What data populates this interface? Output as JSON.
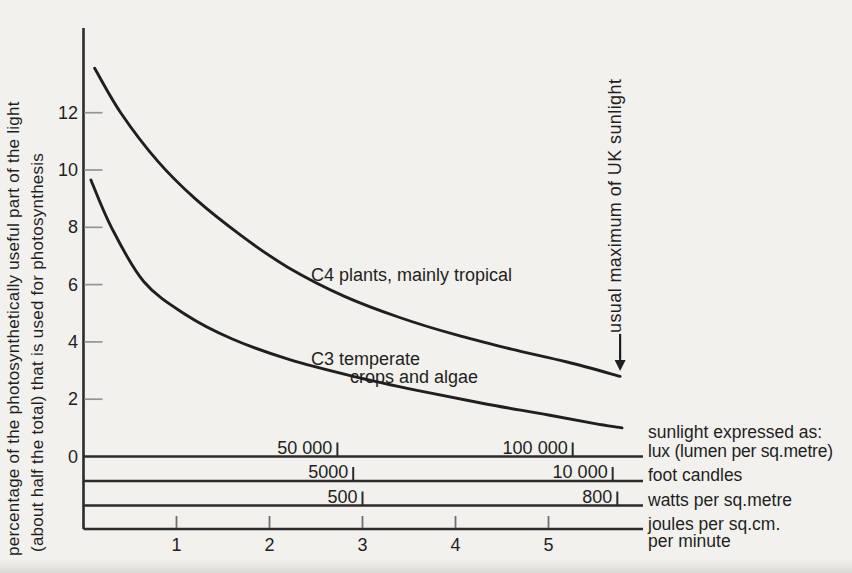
{
  "colors": {
    "background": "#f2f1ed",
    "ink": "#1f1f1f",
    "axis_line": "#2b2b2b",
    "minor_tick": "#949494",
    "bottom_tick": "#6f6f6f"
  },
  "labels": {
    "ylabel_line1": "percentage of the photosynthetically useful part of the light",
    "ylabel_line2": "(about half the total) that is used for photosynthesis",
    "c3_line1": "C3 temperate",
    "c3_line2": "crops and algae",
    "unit_joules_1": "joules per sq.cm.",
    "unit_joules_2": "per minute"
  },
  "chart_data": {
    "type": "line",
    "title": "",
    "ylabel": "percentage of the photosynthetically useful part of the light (about half the total) that is used for photosynthesis",
    "xlabel": "joules per sq.cm. per minute",
    "ylim": [
      0,
      14.9
    ],
    "xlim": [
      0,
      6.02
    ],
    "grid": false,
    "legend_position": "inline-annotations",
    "y_ticks": [
      0,
      2,
      4,
      6,
      8,
      10,
      12
    ],
    "series": [
      {
        "name": "C4 plants, mainly tropical",
        "points": [
          [
            0.12,
            13.55
          ],
          [
            0.4,
            12.0
          ],
          [
            0.8,
            10.3
          ],
          [
            1.2,
            9.0
          ],
          [
            1.7,
            7.7
          ],
          [
            2.2,
            6.6
          ],
          [
            2.8,
            5.6
          ],
          [
            3.4,
            4.85
          ],
          [
            4.0,
            4.25
          ],
          [
            4.6,
            3.75
          ],
          [
            5.2,
            3.3
          ],
          [
            5.77,
            2.8
          ]
        ]
      },
      {
        "name": "C3 temperate crops and algae",
        "points": [
          [
            0.08,
            9.65
          ],
          [
            0.3,
            8.0
          ],
          [
            0.65,
            6.1
          ],
          [
            1.1,
            4.95
          ],
          [
            1.6,
            4.1
          ],
          [
            2.2,
            3.4
          ],
          [
            2.9,
            2.8
          ],
          [
            3.6,
            2.3
          ],
          [
            4.3,
            1.85
          ],
          [
            5.0,
            1.45
          ],
          [
            5.5,
            1.15
          ],
          [
            5.79,
            1.0
          ]
        ]
      }
    ],
    "annotation": {
      "text": "usual maximum of UK sunlight",
      "x": 5.77,
      "arrow_from_y": 4.28,
      "arrow_head_y": 3.37,
      "arrow_tip_y": 2.98
    },
    "scales_header": "sunlight expressed as:",
    "x_scales": [
      {
        "unit": "lux (lumen per sq.metre)",
        "ticks": [
          {
            "label": "50 000",
            "x": 2.73
          },
          {
            "label": "100 000",
            "x": 5.26
          }
        ]
      },
      {
        "unit": "foot candles",
        "ticks": [
          {
            "label": "5000",
            "x": 2.9
          },
          {
            "label": "10 000",
            "x": 5.69
          }
        ]
      },
      {
        "unit": "watts per sq.metre",
        "ticks": [
          {
            "label": "500",
            "x": 3.0
          },
          {
            "label": "800",
            "x": 5.74
          }
        ]
      },
      {
        "unit": "joules per sq.cm. per minute",
        "ticks": [
          {
            "label": "1",
            "x": 1
          },
          {
            "label": "2",
            "x": 2
          },
          {
            "label": "3",
            "x": 3
          },
          {
            "label": "4",
            "x": 4
          },
          {
            "label": "5",
            "x": 5
          }
        ]
      }
    ]
  }
}
